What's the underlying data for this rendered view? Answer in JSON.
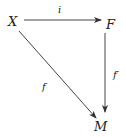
{
  "diagram": {
    "type": "commutative-diagram",
    "colors": {
      "line": "#333333",
      "text": "#222222",
      "background": "#ffffff"
    },
    "nodes": [
      {
        "id": "X",
        "label": "X"
      },
      {
        "id": "F",
        "label": "F"
      },
      {
        "id": "M",
        "label": "M"
      }
    ],
    "edges": [
      {
        "from": "X",
        "to": "F",
        "label": "i"
      },
      {
        "from": "F",
        "to": "M",
        "label": "f′"
      },
      {
        "from": "X",
        "to": "M",
        "label": "f"
      }
    ]
  }
}
